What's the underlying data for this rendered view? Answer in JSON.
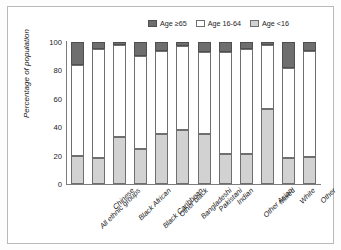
{
  "chart_data": {
    "type": "bar",
    "subtype": "stacked-vertical-100",
    "title": "",
    "xlabel": "",
    "ylabel": "Percentage of population",
    "ylim": [
      0,
      100
    ],
    "yticks": [
      0,
      20,
      40,
      60,
      80,
      100
    ],
    "grid": false,
    "legend_position": "top-right",
    "categories": [
      "All ethnic groups",
      "Chinese",
      "Black African",
      "Black Caribbean",
      "Other black",
      "Bangladeshi",
      "Pakistani",
      "Indian",
      "Other Asian",
      "Mixed",
      "White",
      "Other"
    ],
    "series": [
      {
        "name": "Age <16",
        "color": "#d2d2d2",
        "values": [
          20,
          18,
          33,
          25,
          35,
          38,
          35,
          21,
          21,
          53,
          18,
          19
        ]
      },
      {
        "name": "Age 16-64",
        "color": "#ffffff",
        "values": [
          64,
          77,
          65,
          65,
          59,
          59,
          58,
          72,
          74,
          45,
          64,
          75
        ]
      },
      {
        "name": "Age ≥65",
        "color": "#6e6e6e",
        "values": [
          16,
          5,
          2,
          10,
          6,
          3,
          7,
          7,
          5,
          2,
          18,
          6
        ]
      }
    ]
  },
  "legend": {
    "entries": [
      {
        "label": "Age ≥65",
        "color": "#6e6e6e"
      },
      {
        "label": "Age 16-64",
        "color": "#ffffff"
      },
      {
        "label": "Age <16",
        "color": "#d2d2d2"
      }
    ]
  },
  "axes": {
    "y_title": "Percentage of population",
    "y_tick_labels": [
      "100",
      "80",
      "60",
      "40",
      "20",
      "0"
    ]
  },
  "colors": {
    "age_65_plus": "#6e6e6e",
    "age_16_64": "#ffffff",
    "age_under_16": "#d2d2d2",
    "axis": "#7d7d7d",
    "frame_border": "#b9b9b9",
    "background": "#ffffff"
  }
}
